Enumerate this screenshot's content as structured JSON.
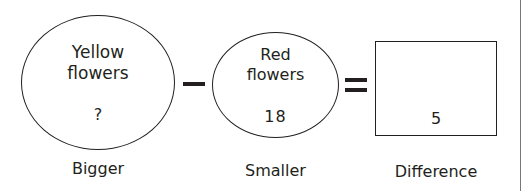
{
  "diagram": {
    "bigger": {
      "title_line1": "Yellow",
      "title_line2": "flowers",
      "value": "?",
      "label": "Bigger"
    },
    "operator1": "minus",
    "smaller": {
      "title_line1": "Red",
      "title_line2": "flowers",
      "value": "18",
      "label": "Smaller"
    },
    "operator2": "equals",
    "difference": {
      "value": "5",
      "label": "Difference"
    }
  }
}
